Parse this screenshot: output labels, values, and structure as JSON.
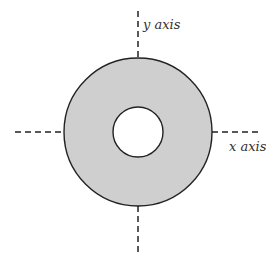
{
  "diagram": {
    "labels": {
      "y_axis": "y axis",
      "x_axis": "x axis"
    },
    "colors": {
      "ring_fill": "#cfcfcf",
      "stroke": "#222222",
      "background": "#ffffff"
    },
    "shape": "annulus"
  }
}
